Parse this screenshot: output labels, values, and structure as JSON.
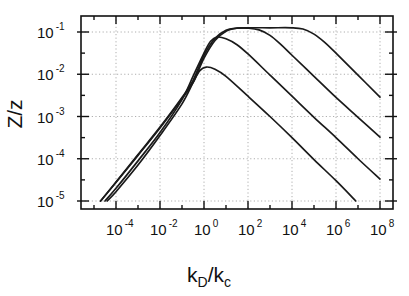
{
  "chart_data": {
    "type": "line",
    "title": "",
    "xlabel": "k_D/k_c",
    "xlabel_main": "k",
    "xlabel_sub1": "D",
    "xlabel_slash": "/k",
    "xlabel_sub2": "c",
    "ylabel": "Z/z",
    "xscale": "log",
    "yscale": "log",
    "xlim": [
      1e-05,
      300000000.0
    ],
    "ylim": [
      6e-06,
      0.24
    ],
    "grid": true,
    "legend": null,
    "x_ticks": [
      {
        "base": "10",
        "exp": "-4",
        "log": -4
      },
      {
        "base": "10",
        "exp": "-2",
        "log": -2
      },
      {
        "base": "10",
        "exp": "0",
        "log": 0
      },
      {
        "base": "10",
        "exp": "2",
        "log": 2
      },
      {
        "base": "10",
        "exp": "4",
        "log": 4
      },
      {
        "base": "10",
        "exp": "6",
        "log": 6
      },
      {
        "base": "10",
        "exp": "8",
        "log": 8
      }
    ],
    "y_ticks": [
      {
        "base": "10",
        "exp": "-1",
        "log": -1
      },
      {
        "base": "10",
        "exp": "-2",
        "log": -2
      },
      {
        "base": "10",
        "exp": "-3",
        "log": -3
      },
      {
        "base": "10",
        "exp": "-4",
        "log": -4
      },
      {
        "base": "10",
        "exp": "-5",
        "log": -5
      }
    ],
    "series_format": "points are [log10(x), log10(y)]",
    "series": [
      {
        "name": "curve-1",
        "points": [
          [
            -4.7,
            -5.0
          ],
          [
            -4.0,
            -4.55
          ],
          [
            -3.0,
            -3.9
          ],
          [
            -2.0,
            -3.25
          ],
          [
            -1.0,
            -2.55
          ],
          [
            -0.5,
            -2.15
          ],
          [
            0.0,
            -1.55
          ],
          [
            0.5,
            -1.15
          ],
          [
            1.0,
            -0.96
          ],
          [
            1.5,
            -0.91
          ],
          [
            2.0,
            -0.9
          ],
          [
            3.0,
            -0.9
          ],
          [
            4.0,
            -0.9
          ],
          [
            4.5,
            -0.93
          ],
          [
            5.0,
            -1.05
          ],
          [
            5.5,
            -1.25
          ],
          [
            6.0,
            -1.5
          ],
          [
            7.0,
            -2.02
          ],
          [
            8.0,
            -2.54
          ]
        ]
      },
      {
        "name": "curve-2",
        "points": [
          [
            -4.7,
            -5.0
          ],
          [
            -4.0,
            -4.56
          ],
          [
            -3.0,
            -3.92
          ],
          [
            -2.0,
            -3.27
          ],
          [
            -1.0,
            -2.58
          ],
          [
            -0.5,
            -2.2
          ],
          [
            0.0,
            -1.62
          ],
          [
            0.5,
            -1.2
          ],
          [
            1.0,
            -0.98
          ],
          [
            1.5,
            -0.91
          ],
          [
            2.0,
            -0.91
          ],
          [
            2.5,
            -0.95
          ],
          [
            3.0,
            -1.08
          ],
          [
            3.5,
            -1.3
          ],
          [
            4.0,
            -1.55
          ],
          [
            5.0,
            -2.05
          ],
          [
            6.0,
            -2.55
          ],
          [
            7.0,
            -3.02
          ],
          [
            8.0,
            -3.49
          ]
        ]
      },
      {
        "name": "curve-3",
        "points": [
          [
            -4.5,
            -5.0
          ],
          [
            -4.0,
            -4.7
          ],
          [
            -3.0,
            -4.05
          ],
          [
            -2.0,
            -3.38
          ],
          [
            -1.0,
            -2.6
          ],
          [
            -0.5,
            -2.05
          ],
          [
            0.0,
            -1.5
          ],
          [
            0.3,
            -1.22
          ],
          [
            0.6,
            -1.12
          ],
          [
            1.0,
            -1.16
          ],
          [
            1.5,
            -1.3
          ],
          [
            2.0,
            -1.52
          ],
          [
            3.0,
            -2.02
          ],
          [
            4.0,
            -2.52
          ],
          [
            5.0,
            -3.02
          ],
          [
            6.0,
            -3.5
          ],
          [
            7.0,
            -4.0
          ],
          [
            8.0,
            -4.48
          ]
        ]
      },
      {
        "name": "curve-4",
        "points": [
          [
            -4.4,
            -5.0
          ],
          [
            -4.0,
            -4.78
          ],
          [
            -3.0,
            -4.15
          ],
          [
            -2.0,
            -3.45
          ],
          [
            -1.0,
            -2.7
          ],
          [
            -0.5,
            -2.2
          ],
          [
            -0.2,
            -1.92
          ],
          [
            0.1,
            -1.83
          ],
          [
            0.5,
            -1.88
          ],
          [
            1.0,
            -2.05
          ],
          [
            2.0,
            -2.52
          ],
          [
            3.0,
            -3.0
          ],
          [
            4.0,
            -3.5
          ],
          [
            5.0,
            -4.02
          ],
          [
            6.0,
            -4.52
          ],
          [
            6.9,
            -5.0
          ]
        ]
      }
    ]
  },
  "layout": {
    "frame": {
      "left": 81,
      "top": 16,
      "right": 393,
      "bottom": 209
    },
    "x_origin_px": 116,
    "x_origin_log": -4,
    "x_px_per_decade": 22,
    "y_origin_px": 32,
    "y_origin_log": -1,
    "y_px_per_decade": 42.25
  }
}
